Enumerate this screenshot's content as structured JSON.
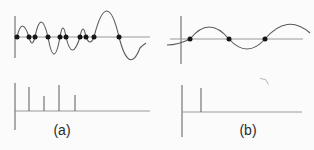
{
  "figure": {
    "background": "#fbfbfb",
    "line_color": "#5a5a5a",
    "baseline_color": "#8f8f8f",
    "dot_color": "#161616",
    "artifact_color": "#b5b5b5",
    "text_color": "#2a2a2a",
    "panels": [
      {
        "id": "a",
        "label": "(a)",
        "signal": {
          "baseline_y": 37,
          "dot_radius": 2.5,
          "sample_dots_x": [
            17,
            29,
            35,
            48,
            60,
            66,
            80,
            86,
            94,
            119
          ]
        },
        "spectrum": {
          "baseline_y": 111,
          "spikes": [
            {
              "x": 29,
              "top": 87
            },
            {
              "x": 44,
              "top": 96
            },
            {
              "x": 59,
              "top": 85
            },
            {
              "x": 75,
              "top": 95
            }
          ]
        }
      },
      {
        "id": "b",
        "label": "(b)",
        "signal": {
          "baseline_y": 39,
          "dot_radius": 2.5,
          "sample_dots_x": [
            190,
            229,
            265
          ]
        },
        "spectrum": {
          "baseline_y": 112,
          "spikes": [
            {
              "x": 201,
              "top": 88
            }
          ]
        }
      }
    ]
  }
}
